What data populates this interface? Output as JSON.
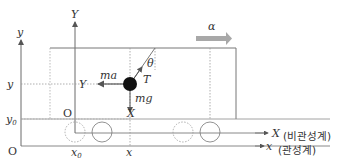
{
  "diagram": {
    "acceleration": {
      "label": "α",
      "color": "#a8a8a8"
    },
    "labels": {
      "inertial_y_axis": "y",
      "inertial_x_axis": "x",
      "inertial_origin": "O",
      "inertial_frame_name": "(관성계)",
      "noninertial_y_axis": "Y",
      "noninertial_x_axis": "X",
      "noninertial_origin": "O",
      "noninertial_frame_name": "(비관성계)",
      "y_position": "y",
      "y0_position": "y",
      "y0_sub": "0",
      "x0_position": "x",
      "x0_sub": "0",
      "x_position": "x",
      "Y_coord": "Y",
      "X_coord": "X",
      "inertial_force": "ma",
      "tension": "T",
      "gravity": "mg",
      "angle": "θ"
    },
    "colors": {
      "lines": "#6a6a6a",
      "dotted": "#9a9a9a",
      "bob": "#111111",
      "text": "#333333"
    }
  }
}
